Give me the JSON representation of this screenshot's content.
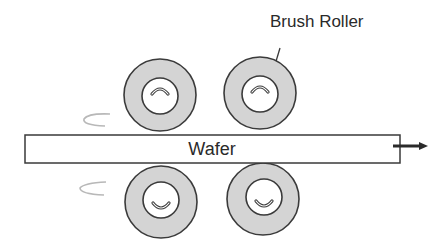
{
  "diagram": {
    "labels": {
      "brush_roller": "Brush Roller",
      "wafer": "Wafer"
    },
    "rollers": [
      {
        "id": "top-left",
        "position": "top",
        "rotation": "clockwise"
      },
      {
        "id": "top-right",
        "position": "top",
        "rotation": "clockwise"
      },
      {
        "id": "bottom-left",
        "position": "bottom",
        "rotation": "counter-clockwise"
      },
      {
        "id": "bottom-right",
        "position": "bottom",
        "rotation": "counter-clockwise"
      }
    ],
    "wafer_motion": "right",
    "colors": {
      "roller_fill": "#d4d4d4",
      "stroke": "#3a3a3a",
      "swirl": "#b8b8b8"
    }
  }
}
